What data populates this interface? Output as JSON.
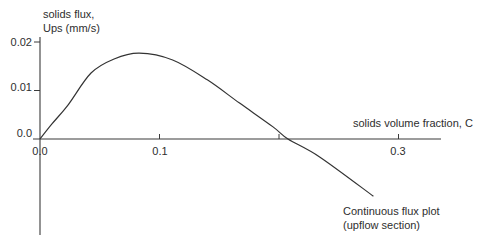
{
  "chart_data": {
    "type": "line",
    "title": "",
    "xlabel": "solids volume fraction, C",
    "ylabel": "solids flux, Ups (mm/s)",
    "ylabel_lines": [
      "solids flux,",
      "Ups (mm/s)"
    ],
    "xlim": [
      0.0,
      0.335
    ],
    "ylim": [
      -0.0198,
      0.021
    ],
    "grid": false,
    "legend": null,
    "x_ticks": [
      {
        "value": 0.0,
        "label": "0.0"
      },
      {
        "value": 0.1,
        "label": "0.1"
      },
      {
        "value": 0.2,
        "label": ""
      },
      {
        "value": 0.3,
        "label": "0.3"
      }
    ],
    "y_ticks": [
      {
        "value": 0.02,
        "label": "0.02"
      },
      {
        "value": 0.01,
        "label": "0.01"
      },
      {
        "value": 0.0,
        "label": "0.0"
      }
    ],
    "annotations": [
      {
        "text_lines": [
          "Continuous flux plot",
          "(upflow section)"
        ],
        "points_to": {
          "x": 0.279,
          "y": -0.0118
        }
      }
    ],
    "series": [
      {
        "name": "Continuous flux plot (upflow section)",
        "x": [
          0.0,
          0.01,
          0.0234,
          0.0427,
          0.062,
          0.083,
          0.111,
          0.14,
          0.167,
          0.195,
          0.2075,
          0.234,
          0.279
        ],
        "y": [
          0.0,
          0.0031,
          0.007,
          0.0136,
          0.0165,
          0.0177,
          0.0163,
          0.0122,
          0.0074,
          0.0025,
          0.0,
          -0.0037,
          -0.0118
        ]
      }
    ]
  }
}
